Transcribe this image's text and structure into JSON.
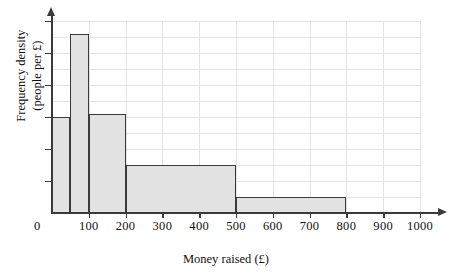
{
  "chart_data": {
    "type": "bar",
    "title": "",
    "xlabel": "Money raised (£)",
    "ylabel": "Frequency density (people per £)",
    "ylabel_line1": "Frequency density",
    "ylabel_line2": "(people per £)",
    "xlim": [
      0,
      1000
    ],
    "ylim": [
      0,
      6
    ],
    "grid": true,
    "legend": null,
    "x_ticks": [
      0,
      100,
      200,
      300,
      400,
      500,
      600,
      700,
      800,
      900,
      1000
    ],
    "x_tick_labels": [
      "0",
      "100",
      "200",
      "300",
      "400",
      "500",
      "600",
      "700",
      "800",
      "900",
      "1000"
    ],
    "y_ticks": [
      0,
      1,
      2,
      3,
      4,
      5,
      6
    ],
    "y_tick_labels": [
      "",
      "",
      "",
      "",
      "",
      "",
      ""
    ],
    "bin_edges": [
      0,
      50,
      100,
      200,
      500,
      800
    ],
    "bars": [
      {
        "label": "0–50",
        "x0": 0,
        "x1": 50,
        "frequency_density": 3.0,
        "frequency": 150
      },
      {
        "label": "50–100",
        "x0": 50,
        "x1": 100,
        "frequency_density": 5.6,
        "frequency": 280
      },
      {
        "label": "100–200",
        "x0": 100,
        "x1": 200,
        "frequency_density": 3.1,
        "frequency": 310
      },
      {
        "label": "200–500",
        "x0": 200,
        "x1": 500,
        "frequency_density": 1.5,
        "frequency": 450
      },
      {
        "label": "500–800",
        "x0": 500,
        "x1": 800,
        "frequency_density": 0.5,
        "frequency": 150
      }
    ],
    "colors": {
      "bar_fill": "#e2e2e2",
      "bar_stroke": "#3a3a3a",
      "axis": "#3a3a3a",
      "grid": "#e3e3e3",
      "background": "#ffffff"
    }
  }
}
